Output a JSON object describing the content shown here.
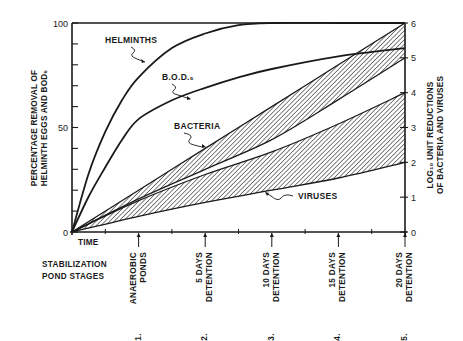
{
  "chart_data": {
    "type": "line",
    "title": "",
    "xlabel": "TIME",
    "ylabel": "PERCENTAGE REMOVAL OF HELMINTH EGGS AND BOD5",
    "ylabel_right": "LOG10 UNIT REDUCTIONS OF BACTERIA AND VIRUSES",
    "ylabel_lines": [
      "PERCENTAGE REMOVAL OF",
      "HELMINTH EGGS AND BOD₅"
    ],
    "ylabel_right_lines": [
      "LOG₁₀ UNIT REDUCTIONS",
      "OF BACTERIA AND VIRUSES"
    ],
    "ylim": [
      0,
      100
    ],
    "ylim_right": [
      0,
      6
    ],
    "yticks_left": [
      0,
      50,
      100
    ],
    "yticks_left_minor_step": 10,
    "yticks_right": [
      0,
      1,
      2,
      3,
      4,
      5,
      6
    ],
    "grid": false,
    "x": [
      0,
      1,
      2,
      3,
      4,
      5
    ],
    "x_stage_title_lines": [
      "STABILIZATION",
      "POND STAGES"
    ],
    "x_stages": [
      {
        "num": "1.",
        "lines": [
          "ANAEROBIC",
          "PONDS"
        ],
        "x": 1
      },
      {
        "num": "2.",
        "lines": [
          "5 DAYS",
          "DETENTION"
        ],
        "x": 2
      },
      {
        "num": "3.",
        "lines": [
          "10 DAYS",
          "DETENTION"
        ],
        "x": 3
      },
      {
        "num": "4.",
        "lines": [
          "15 DAYS",
          "DETENTION"
        ],
        "x": 4
      },
      {
        "num": "5.",
        "lines": [
          "20 DAYS",
          "DETENTION"
        ],
        "x": 5
      }
    ],
    "series": [
      {
        "name": "HELMINTHS",
        "axis": "left",
        "kind": "line",
        "x": [
          0,
          0.25,
          0.5,
          0.75,
          1,
          1.5,
          2,
          2.5,
          3,
          4,
          5
        ],
        "values": [
          0,
          28,
          48,
          63,
          74,
          88,
          95,
          99,
          100,
          100,
          100
        ]
      },
      {
        "name": "B.O.D.₅",
        "axis": "left",
        "kind": "line",
        "x": [
          0,
          0.25,
          0.5,
          0.75,
          1,
          1.5,
          2,
          2.5,
          3,
          4,
          5
        ],
        "values": [
          0,
          17,
          31,
          44,
          54,
          63,
          69,
          74,
          78,
          84,
          88
        ]
      },
      {
        "name": "BACTERIA",
        "axis": "right",
        "kind": "band",
        "x": [
          0,
          1,
          2,
          3,
          4,
          5
        ],
        "upper": [
          0,
          1.2,
          2.4,
          3.6,
          4.8,
          6.0
        ],
        "lower": [
          0,
          0.95,
          1.8,
          2.65,
          3.8,
          5.0
        ]
      },
      {
        "name": "VIRUSES",
        "axis": "right",
        "kind": "band",
        "x": [
          0,
          1,
          2,
          3,
          4,
          5
        ],
        "upper": [
          0,
          0.9,
          1.65,
          2.3,
          3.1,
          4.0
        ],
        "lower": [
          0,
          0.45,
          0.85,
          1.2,
          1.55,
          2.0
        ]
      }
    ],
    "annotations": [
      {
        "text": "HELMINTHS",
        "series": "HELMINTHS"
      },
      {
        "text": "B.O.D.₅",
        "series": "B.O.D.₅"
      },
      {
        "text": "BACTERIA",
        "series": "BACTERIA"
      },
      {
        "text": "VIRUSES",
        "series": "VIRUSES"
      }
    ]
  }
}
